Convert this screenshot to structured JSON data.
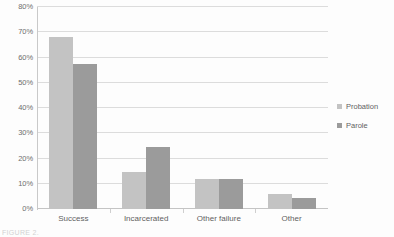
{
  "chart_data": {
    "type": "bar",
    "title": "",
    "xlabel": "",
    "ylabel": "",
    "categories": [
      "Success",
      "Incarcerated",
      "Other failure",
      "Other"
    ],
    "series": [
      {
        "name": "Probation",
        "color": "#c3c3c3",
        "values": [
          68,
          14.5,
          12,
          6
        ]
      },
      {
        "name": "Parole",
        "color": "#9b9b9b",
        "values": [
          57.5,
          24.5,
          12,
          4.5
        ]
      }
    ],
    "ylim": [
      0,
      80
    ],
    "ytick_values": [
      0,
      10,
      20,
      30,
      40,
      50,
      60,
      70,
      80
    ],
    "ytick_labels": [
      "0%",
      "10%",
      "20%",
      "30%",
      "40%",
      "50%",
      "60%",
      "70%",
      "80%"
    ],
    "grid": true,
    "legend_position": "right"
  },
  "legend": {
    "items": [
      {
        "label": "Probation"
      },
      {
        "label": "Parole"
      }
    ]
  },
  "caption": {
    "fragment": "FIGURE 2."
  }
}
